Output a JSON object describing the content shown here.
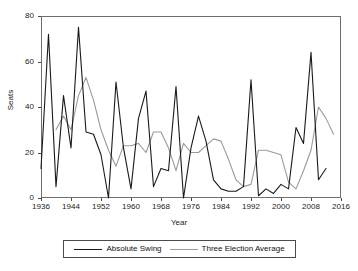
{
  "chart_data": {
    "type": "line",
    "title": "",
    "xlabel": "Year",
    "ylabel": "Seats",
    "xlim": [
      1936,
      2016
    ],
    "ylim": [
      0,
      80
    ],
    "grid": false,
    "legend_position": "bottom-center",
    "xticks": [
      1936,
      1944,
      1952,
      1960,
      1968,
      1976,
      1984,
      1992,
      2000,
      2008,
      2016
    ],
    "yticks": [
      0,
      20,
      40,
      60,
      80
    ],
    "colors": {
      "absolute_swing": "#1a1a1a",
      "three_election_average": "#9a9a9a",
      "axis": "#6e6e6e",
      "background": "#ffffff"
    },
    "x": [
      1936,
      1938,
      1940,
      1942,
      1944,
      1946,
      1948,
      1950,
      1952,
      1954,
      1956,
      1958,
      1960,
      1962,
      1964,
      1966,
      1968,
      1970,
      1972,
      1974,
      1976,
      1978,
      1980,
      1982,
      1984,
      1986,
      1988,
      1990,
      1992,
      1994,
      1996,
      1998,
      2000,
      2002,
      2004,
      2006,
      2008,
      2010,
      2012,
      2014
    ],
    "series": [
      {
        "name": "Absolute Swing",
        "color": "#1a1a1a",
        "values": [
          13,
          72,
          5,
          45,
          22,
          75,
          29,
          28,
          19,
          0,
          51,
          22,
          4,
          35,
          47,
          5,
          13,
          12,
          49,
          0,
          22,
          36,
          25,
          8,
          4,
          3,
          3,
          5,
          52,
          1,
          4,
          2,
          6,
          4,
          31,
          24,
          64,
          8,
          13,
          null
        ]
      },
      {
        "name": "Three Election Average",
        "color": "#9a9a9a",
        "values": [
          null,
          null,
          30,
          36,
          30,
          45,
          53,
          43,
          30,
          21,
          14,
          23,
          23,
          24,
          20,
          29,
          29,
          22,
          12,
          24,
          20,
          20,
          23,
          26,
          25,
          17,
          8,
          5,
          6,
          21,
          21,
          20,
          19,
          7,
          4,
          12,
          21,
          40,
          35,
          28
        ]
      }
    ]
  },
  "legend": {
    "entries": [
      {
        "label": "Absolute Swing",
        "color": "#1a1a1a"
      },
      {
        "label": "Three Election Average",
        "color": "#9a9a9a"
      }
    ]
  },
  "axes": {
    "y_label": "Seats",
    "x_label": "Year",
    "y_tick_labels": [
      "0",
      "20",
      "40",
      "60",
      "80"
    ],
    "x_tick_labels": [
      "1936",
      "1944",
      "1952",
      "1960",
      "1968",
      "1976",
      "1984",
      "1992",
      "2000",
      "2008",
      "2016"
    ]
  }
}
